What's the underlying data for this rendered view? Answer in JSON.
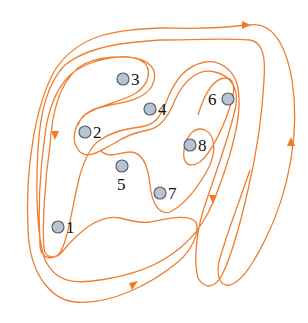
{
  "diagram": {
    "type": "nested-closed-curve",
    "curve_color": "#ef7f2f",
    "node_fill": "#b7c4d2",
    "node_stroke": "#55606c",
    "nodes": [
      {
        "id": "1",
        "label": "1",
        "x": 58,
        "y": 227,
        "label_side": "right"
      },
      {
        "id": "2",
        "label": "2",
        "x": 85,
        "y": 132,
        "label_side": "right"
      },
      {
        "id": "3",
        "label": "3",
        "x": 123,
        "y": 79,
        "label_side": "right"
      },
      {
        "id": "4",
        "label": "4",
        "x": 150,
        "y": 109,
        "label_side": "right"
      },
      {
        "id": "5",
        "label": "5",
        "x": 122,
        "y": 166,
        "label_side": "below"
      },
      {
        "id": "6",
        "label": "6",
        "x": 228,
        "y": 99,
        "label_side": "left"
      },
      {
        "id": "7",
        "label": "7",
        "x": 160,
        "y": 193,
        "label_side": "right"
      },
      {
        "id": "8",
        "label": "8",
        "x": 190,
        "y": 145,
        "label_side": "right"
      }
    ],
    "arrows": [
      {
        "position": "top-right",
        "direction": "right"
      },
      {
        "position": "left",
        "direction": "down"
      },
      {
        "position": "bottom",
        "direction": "up-right"
      },
      {
        "position": "right-outer",
        "direction": "up"
      },
      {
        "position": "right-inner",
        "direction": "down"
      }
    ]
  }
}
